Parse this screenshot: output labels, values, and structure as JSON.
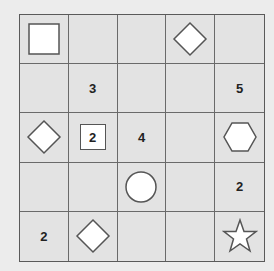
{
  "puzzle": {
    "rows": 5,
    "cols": 5,
    "cells": [
      [
        {
          "type": "square"
        },
        {
          "type": "empty"
        },
        {
          "type": "empty"
        },
        {
          "type": "diamond"
        },
        {
          "type": "empty"
        }
      ],
      [
        {
          "type": "empty"
        },
        {
          "type": "number",
          "value": "3"
        },
        {
          "type": "empty"
        },
        {
          "type": "empty"
        },
        {
          "type": "number",
          "value": "5"
        }
      ],
      [
        {
          "type": "diamond"
        },
        {
          "type": "boxed-number",
          "value": "2"
        },
        {
          "type": "number",
          "value": "4"
        },
        {
          "type": "empty"
        },
        {
          "type": "hexagon"
        }
      ],
      [
        {
          "type": "empty"
        },
        {
          "type": "empty"
        },
        {
          "type": "circle"
        },
        {
          "type": "empty"
        },
        {
          "type": "number",
          "value": "2"
        }
      ],
      [
        {
          "type": "number",
          "value": "2"
        },
        {
          "type": "diamond"
        },
        {
          "type": "empty"
        },
        {
          "type": "empty"
        },
        {
          "type": "star"
        }
      ]
    ]
  },
  "colors": {
    "background": "#ececec",
    "cell_fill": "#e3e3e3",
    "grid_line": "#6a6a6a",
    "shape_fill": "#ffffff",
    "shape_stroke": "#555555",
    "number_text": "#222222"
  }
}
